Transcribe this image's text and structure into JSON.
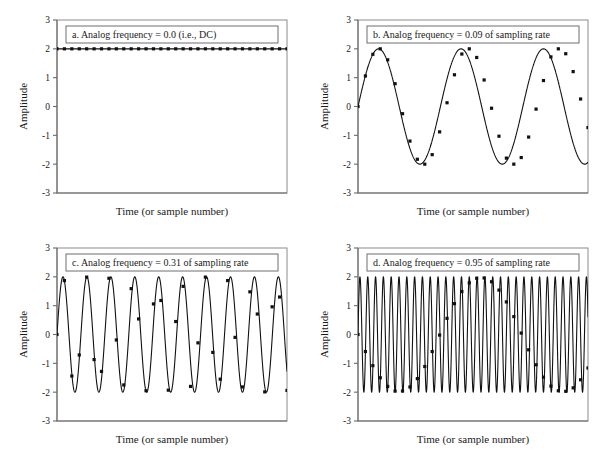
{
  "figure": {
    "background": "#ffffff",
    "ink_color": "#111111",
    "frame_color": "#8c8c8c",
    "panel_count": 4
  },
  "axes_common": {
    "ylabel": "Amplitude",
    "xlabel": "Time (or sample number)",
    "y_ticks": [
      "3",
      "2",
      "1",
      "0",
      "-1",
      "-2",
      "-3"
    ],
    "ylim": [
      -3,
      3
    ],
    "x_ticks_shown": false,
    "grid": false,
    "legend": "none"
  },
  "chart_data": [
    {
      "id": "panel-a",
      "type": "line",
      "title": "a.   Analog frequency = 0.0   (i.e., DC)",
      "letter": "a.",
      "caption": "Analog frequency = 0.0   (i.e., DC)",
      "xlabel": "Time (or sample number)",
      "ylabel": "Amplitude",
      "ylim": [
        -3,
        3
      ],
      "xlim": [
        0,
        31
      ],
      "y_ticks": [
        3,
        2,
        1,
        0,
        -1,
        -2,
        -3
      ],
      "analog_frequency": 0.0,
      "amplitude": 2.0,
      "phase": 1.5707963,
      "n_samples": 32,
      "marker": "square",
      "marker_size": 3.2,
      "sample_values": [
        2,
        2,
        2,
        2,
        2,
        2,
        2,
        2,
        2,
        2,
        2,
        2,
        2,
        2,
        2,
        2,
        2,
        2,
        2,
        2,
        2,
        2,
        2,
        2,
        2,
        2,
        2,
        2,
        2,
        2,
        2,
        2
      ]
    },
    {
      "id": "panel-b",
      "type": "line",
      "title": "b.   Analog frequency = 0.09 of sampling rate",
      "letter": "b.",
      "caption": "Analog frequency = 0.09 of sampling rate",
      "xlabel": "Time (or sample number)",
      "ylabel": "Amplitude",
      "ylim": [
        -3,
        3
      ],
      "xlim": [
        0,
        31
      ],
      "y_ticks": [
        3,
        2,
        1,
        0,
        -1,
        -2,
        -3
      ],
      "analog_frequency": 0.09,
      "amplitude": 2.0,
      "phase": 0.0,
      "n_samples": 32,
      "marker": "square",
      "marker_size": 3.2,
      "sample_values": [
        0.0,
        1.06,
        1.81,
        2.0,
        1.62,
        0.79,
        -0.25,
        -1.2,
        -1.83,
        -2.0,
        -1.67,
        -0.88,
        0.13,
        1.1,
        1.82,
        2.0,
        1.7,
        0.92,
        -0.06,
        -1.03,
        -1.79,
        -2.0,
        -1.77,
        -1.06,
        -0.09,
        0.9,
        1.72,
        2.0,
        1.83,
        1.21,
        0.26,
        -0.73
      ]
    },
    {
      "id": "panel-c",
      "type": "line",
      "title": "c.   Analog frequency = 0.31 of sampling rate",
      "letter": "c.",
      "caption": "Analog frequency = 0.31 of sampling rate",
      "xlabel": "Time (or sample number)",
      "ylabel": "Amplitude",
      "ylim": [
        -3,
        3
      ],
      "xlim": [
        0,
        31
      ],
      "y_ticks": [
        3,
        2,
        1,
        0,
        -1,
        -2,
        -3
      ],
      "analog_frequency": 0.31,
      "amplitude": 2.0,
      "phase": 0.0,
      "n_samples": 32,
      "marker": "square",
      "marker_size": 3.2,
      "sample_values": [
        0.0,
        1.87,
        -1.44,
        -0.71,
        1.99,
        -0.87,
        -1.28,
        1.95,
        -0.19,
        -1.75,
        1.59,
        0.54,
        -1.95,
        1.06,
        1.18,
        -1.93,
        0.45,
        1.67,
        -1.8,
        -0.29,
        1.99,
        -0.62,
        -1.55,
        1.87,
        -0.1,
        -1.82,
        1.48,
        0.71,
        -1.99,
        0.96,
        1.3,
        -1.94
      ]
    },
    {
      "id": "panel-d",
      "type": "line",
      "title": "d.   Analog frequency = 0.95 of sampling rate",
      "letter": "d.",
      "caption": "Analog frequency = 0.95 of sampling rate",
      "xlabel": "Time (or sample number)",
      "ylabel": "Amplitude",
      "ylim": [
        -3,
        3
      ],
      "xlim": [
        0,
        31
      ],
      "y_ticks": [
        3,
        2,
        1,
        0,
        -1,
        -2,
        -3
      ],
      "analog_frequency": 0.95,
      "amplitude": 2.0,
      "phase": 0.0,
      "n_samples": 32,
      "marker": "square",
      "marker_size": 3.2,
      "sample_values": [
        0.0,
        -0.59,
        -1.08,
        -1.5,
        -1.8,
        -1.96,
        -1.96,
        -1.82,
        -1.53,
        -1.11,
        -0.59,
        -0.02,
        0.56,
        1.07,
        1.49,
        1.79,
        1.95,
        1.96,
        1.83,
        1.54,
        1.13,
        0.62,
        0.05,
        -0.53,
        -1.05,
        -1.48,
        -1.79,
        -1.95,
        -1.97,
        -1.85,
        -1.57,
        -1.16
      ]
    }
  ]
}
